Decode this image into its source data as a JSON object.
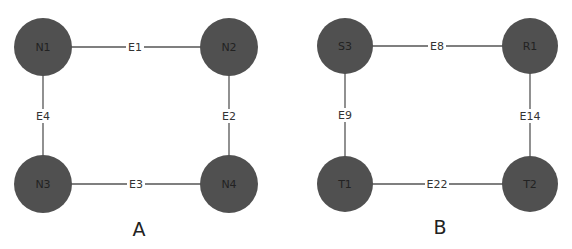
{
  "diagram": {
    "panels": [
      {
        "label": "A",
        "nodes": [
          {
            "id": "N1",
            "label": "N1"
          },
          {
            "id": "N2",
            "label": "N2"
          },
          {
            "id": "N3",
            "label": "N3"
          },
          {
            "id": "N4",
            "label": "N4"
          }
        ],
        "edges": [
          {
            "label": "E1",
            "from": "N1",
            "to": "N2"
          },
          {
            "label": "E2",
            "from": "N2",
            "to": "N4"
          },
          {
            "label": "E3",
            "from": "N3",
            "to": "N4"
          },
          {
            "label": "E4",
            "from": "N1",
            "to": "N3"
          }
        ]
      },
      {
        "label": "B",
        "nodes": [
          {
            "id": "S3",
            "label": "S3"
          },
          {
            "id": "R1",
            "label": "R1"
          },
          {
            "id": "T1",
            "label": "T1"
          },
          {
            "id": "T2",
            "label": "T2"
          }
        ],
        "edges": [
          {
            "label": "E8",
            "from": "S3",
            "to": "R1"
          },
          {
            "label": "E14",
            "from": "R1",
            "to": "T2"
          },
          {
            "label": "E22",
            "from": "T1",
            "to": "T2"
          },
          {
            "label": "E9",
            "from": "S3",
            "to": "T1"
          }
        ]
      }
    ],
    "colors": {
      "node_fill": "#505050",
      "edge": "#555555",
      "text": "#222222",
      "background": "#ffffff"
    }
  }
}
